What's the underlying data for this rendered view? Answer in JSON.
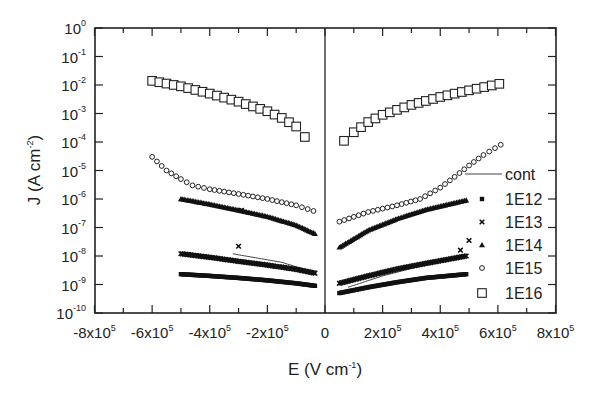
{
  "chart_data": {
    "type": "scatter",
    "title": "",
    "xlabel": "E (V cm^-1)",
    "ylabel": "J (A cm^-2)",
    "xscale": "linear",
    "yscale": "log",
    "xlim": [
      -800000,
      800000
    ],
    "ylim": [
      1e-10,
      1
    ],
    "grid": false,
    "legend_position": "right inside",
    "x_ticks": [
      {
        "value": -800000,
        "base": "-8x10",
        "exp": "5"
      },
      {
        "value": -600000,
        "base": "-6x10",
        "exp": "5"
      },
      {
        "value": -400000,
        "base": "-4x10",
        "exp": "5"
      },
      {
        "value": -200000,
        "base": "-2x10",
        "exp": "5"
      },
      {
        "value": 0,
        "base": "0",
        "exp": ""
      },
      {
        "value": 200000,
        "base": "2x10",
        "exp": "5"
      },
      {
        "value": 400000,
        "base": "4x10",
        "exp": "5"
      },
      {
        "value": 600000,
        "base": "6x10",
        "exp": "5"
      },
      {
        "value": 800000,
        "base": "8x10",
        "exp": "5"
      }
    ],
    "y_ticks": [
      {
        "value": 1,
        "base": "10",
        "exp": "0"
      },
      {
        "value": 0.1,
        "base": "10",
        "exp": "-1"
      },
      {
        "value": 0.01,
        "base": "10",
        "exp": "-2"
      },
      {
        "value": 0.001,
        "base": "10",
        "exp": "-3"
      },
      {
        "value": 0.0001,
        "base": "10",
        "exp": "-4"
      },
      {
        "value": 1e-05,
        "base": "10",
        "exp": "-5"
      },
      {
        "value": 1e-06,
        "base": "10",
        "exp": "-6"
      },
      {
        "value": 1e-07,
        "base": "10",
        "exp": "-7"
      },
      {
        "value": 1e-08,
        "base": "10",
        "exp": "-8"
      },
      {
        "value": 1e-09,
        "base": "10",
        "exp": "-9"
      },
      {
        "value": 1e-10,
        "base": "10",
        "exp": "-10"
      }
    ],
    "series": [
      {
        "name": "cont",
        "marker": "line",
        "segments": [
          {
            "x": [
              -320000,
              -250000,
              -150000,
              -35000
            ],
            "y": [
              1.2e-08,
              9e-09,
              6e-09,
              2.6e-09
            ]
          },
          {
            "x": [
              80000,
              200000,
              350000,
              490000
            ],
            "y": [
              8e-10,
              2e-09,
              5e-09,
              1.2e-08
            ]
          }
        ]
      },
      {
        "name": "1E12",
        "marker": "filled-square",
        "segments": [
          {
            "x": [
              -500000,
              -400000,
              -300000,
              -200000,
              -100000,
              -35000
            ],
            "y": [
              2.3e-09,
              2e-09,
              1.7e-09,
              1.4e-09,
              1.1e-09,
              9e-10
            ]
          },
          {
            "x": [
              50000,
              150000,
              250000,
              350000,
              490000
            ],
            "y": [
              5e-10,
              8e-10,
              1.2e-09,
              1.7e-09,
              2.3e-09
            ]
          }
        ]
      },
      {
        "name": "1E13",
        "marker": "x-cross",
        "segments": [
          {
            "x": [
              -500000,
              -400000,
              -300000,
              -200000,
              -100000,
              -35000
            ],
            "y": [
              1.2e-08,
              9e-09,
              6.5e-09,
              4.8e-09,
              3.4e-09,
              2.5e-09
            ]
          },
          {
            "x": [
              50000,
              150000,
              250000,
              350000,
              490000
            ],
            "y": [
              1.1e-09,
              2e-09,
              3.5e-09,
              5.5e-09,
              1e-08
            ]
          }
        ],
        "outliers": [
          {
            "x": -290000,
            "y": 4e-07
          },
          {
            "x": -300000,
            "y": 2.2e-08
          },
          {
            "x": 500000,
            "y": 3.5e-08
          },
          {
            "x": 470000,
            "y": 1.6e-08
          }
        ]
      },
      {
        "name": "1E14",
        "marker": "filled-triangle",
        "segments": [
          {
            "x": [
              -500000,
              -400000,
              -300000,
              -200000,
              -100000,
              -35000
            ],
            "y": [
              1e-06,
              6.5e-07,
              4e-07,
              2.4e-07,
              1.2e-07,
              6e-08
            ]
          },
          {
            "x": [
              50000,
              150000,
              250000,
              350000,
              490000
            ],
            "y": [
              2e-08,
              8e-08,
              2e-07,
              4.2e-07,
              9e-07
            ]
          }
        ]
      },
      {
        "name": "1E15",
        "marker": "open-circle",
        "segments": [
          {
            "x": [
              -600000,
              -550000,
              -500000,
              -460000,
              -400000,
              -300000,
              -200000,
              -100000,
              -40000
            ],
            "y": [
              3e-05,
              1e-05,
              5e-06,
              3e-06,
              2.2e-06,
              1.5e-06,
              1e-06,
              6e-07,
              3.8e-07
            ]
          },
          {
            "x": [
              50000,
              150000,
              250000,
              330000,
              400000,
              450000,
              500000,
              550000,
              610000
            ],
            "y": [
              1.6e-07,
              3.5e-07,
              6e-07,
              1e-06,
              2.5e-06,
              6e-06,
              1.5e-05,
              3.5e-05,
              8e-05
            ]
          }
        ]
      },
      {
        "name": "1E16",
        "marker": "open-square",
        "segments": [
          {
            "x": [
              -600000,
              -500000,
              -400000,
              -300000,
              -200000,
              -150000,
              -100000,
              -70000
            ],
            "y": [
              0.014,
              0.009,
              0.005,
              0.0026,
              0.0012,
              0.0007,
              0.00035,
              0.00015
            ]
          },
          {
            "x": [
              66000,
              100000,
              150000,
              200000,
              300000,
              400000,
              500000,
              605000
            ],
            "y": [
              0.00011,
              0.00022,
              0.0005,
              0.0009,
              0.002,
              0.0038,
              0.0065,
              0.011
            ]
          }
        ]
      }
    ]
  },
  "legend": {
    "items": [
      {
        "label": "cont",
        "marker": "line"
      },
      {
        "label": "1E12",
        "marker": "filled-square"
      },
      {
        "label": "1E13",
        "marker": "x-cross"
      },
      {
        "label": "1E14",
        "marker": "filled-triangle"
      },
      {
        "label": "1E15",
        "marker": "open-circle"
      },
      {
        "label": "1E16",
        "marker": "open-square"
      }
    ]
  },
  "axes": {
    "x_title_base": "E (V cm",
    "x_title_exp": "-1",
    "x_title_end": ")",
    "y_title_base": "J (A cm",
    "y_title_exp": "-2",
    "y_title_end": ")"
  }
}
